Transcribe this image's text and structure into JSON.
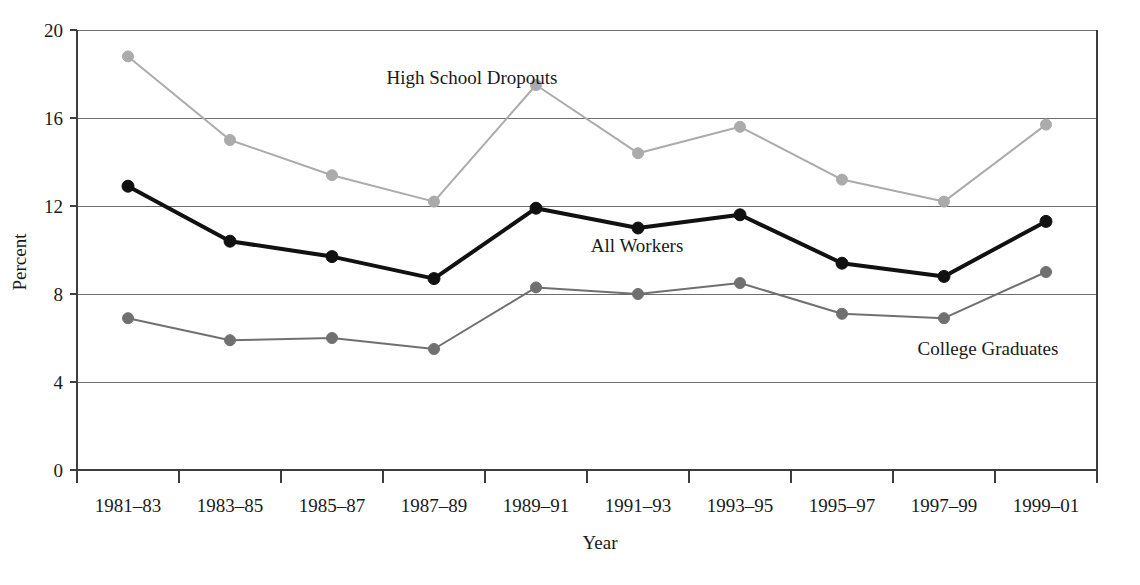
{
  "chart_data": {
    "type": "line",
    "title": "",
    "xlabel": "Year",
    "ylabel": "Percent",
    "categories": [
      "1981–83",
      "1983–85",
      "1985–87",
      "1987–89",
      "1989–91",
      "1991–93",
      "1993–95",
      "1995–97",
      "1997–99",
      "1999–01"
    ],
    "ylim": [
      0,
      20
    ],
    "yticks": [
      0,
      4,
      8,
      12,
      16,
      20
    ],
    "ytick_labels": [
      "0",
      "4",
      "8",
      "12",
      "16",
      "20"
    ],
    "grid": "horizontal",
    "legend_position": "inline-annotations",
    "series": [
      {
        "name": "High School Dropouts",
        "color": "#ababab",
        "marker_color": "#ababab",
        "line_width": 2,
        "values": [
          18.8,
          15.0,
          13.4,
          12.2,
          17.5,
          14.4,
          15.6,
          13.2,
          12.2,
          15.7
        ]
      },
      {
        "name": "All Workers",
        "color": "#111111",
        "marker_color": "#111111",
        "line_width": 4,
        "values": [
          12.9,
          10.4,
          9.7,
          8.7,
          11.9,
          11.0,
          11.6,
          9.4,
          8.8,
          11.3
        ]
      },
      {
        "name": "College Graduates",
        "color": "#707070",
        "marker_color": "#707070",
        "line_width": 2,
        "values": [
          6.9,
          5.9,
          6.0,
          5.5,
          8.3,
          8.0,
          8.5,
          7.1,
          6.9,
          9.0
        ]
      }
    ],
    "annotations": [
      {
        "text": "High School Dropouts",
        "series": "High School Dropouts",
        "x": 472,
        "y": 84
      },
      {
        "text": "All Workers",
        "series": "All Workers",
        "x": 637,
        "y": 252
      },
      {
        "text": "College Graduates",
        "series": "College Graduates",
        "x": 988,
        "y": 355
      }
    ]
  },
  "axes": {
    "y_title": "Percent",
    "x_title": "Year"
  }
}
